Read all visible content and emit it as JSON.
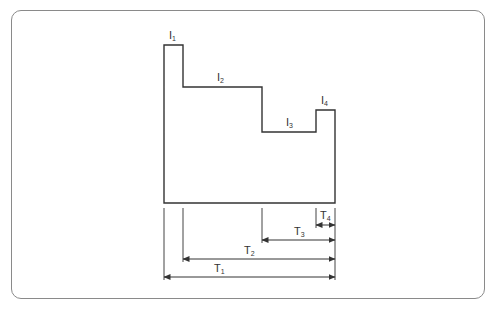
{
  "diagram": {
    "type": "stepped load profile with duration dimensions",
    "levels": [
      {
        "id": "l1",
        "label": "I",
        "sub": "1"
      },
      {
        "id": "l2",
        "label": "I",
        "sub": "2"
      },
      {
        "id": "l3",
        "label": "I",
        "sub": "3"
      },
      {
        "id": "l4",
        "label": "I",
        "sub": "4"
      }
    ],
    "durations": [
      {
        "id": "T1",
        "label": "T",
        "sub": "1"
      },
      {
        "id": "T2",
        "label": "T",
        "sub": "2"
      },
      {
        "id": "T3",
        "label": "T",
        "sub": "3"
      },
      {
        "id": "T4",
        "label": "T",
        "sub": "4"
      }
    ],
    "colors": {
      "line": "#333333",
      "frame": "#8a8a8a",
      "background": "#ffffff"
    }
  }
}
